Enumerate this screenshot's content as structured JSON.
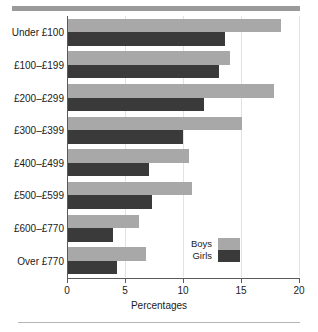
{
  "chart_data": {
    "type": "bar",
    "orientation": "horizontal",
    "title": "",
    "xlabel": "Percentages",
    "ylabel": "",
    "xlim": [
      0,
      20
    ],
    "xticks": [
      0,
      5,
      10,
      15,
      20
    ],
    "xtick_labels": [
      "0",
      "5",
      "10",
      "15",
      "20"
    ],
    "grid": true,
    "legend_position": "bottom-right",
    "categories": [
      "Under £100",
      "£100–£199",
      "£200–£299",
      "£300–£399",
      "£400–£499",
      "£500–£599",
      "£600–£770",
      "Over £770"
    ],
    "series": [
      {
        "name": "Boys",
        "color": "#a8a8a8",
        "values": [
          18.4,
          14.0,
          17.8,
          15.0,
          10.4,
          10.7,
          6.1,
          6.7
        ]
      },
      {
        "name": "Girls",
        "color": "#3a3a3a",
        "values": [
          13.5,
          13.0,
          11.7,
          9.9,
          7.0,
          7.2,
          3.9,
          4.2
        ]
      }
    ]
  },
  "legend": {
    "items": [
      {
        "label": "Boys"
      },
      {
        "label": "Girls"
      }
    ]
  },
  "colors": {
    "boys": "#a8a8a8",
    "girls": "#3a3a3a",
    "axis": "#5a5a5a",
    "grid": "#e2e2e2",
    "rule": "#9a9a9a"
  }
}
